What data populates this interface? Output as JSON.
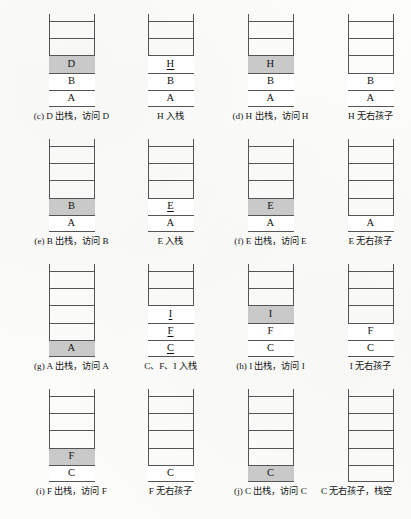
{
  "figure": {
    "type": "stack-trace-diagram",
    "colors": {
      "page_background": "#fdfdfc",
      "stack_line": "#555555",
      "cell_fill": "#ffffff",
      "highlight_fill": "#c9c9c9",
      "text": "#111111"
    },
    "stack_capacity": 5,
    "panels": [
      {
        "id": "panel-c-pop-d",
        "row": 1,
        "col": 1,
        "caption": "(c) D 出栈，访问 D",
        "cells": [
          {
            "label": "",
            "state": "empty",
            "underlined": false
          },
          {
            "label": "",
            "state": "empty",
            "underlined": false
          },
          {
            "label": "D",
            "state": "highlight",
            "underlined": false
          },
          {
            "label": "B",
            "state": "filled",
            "underlined": false
          },
          {
            "label": "A",
            "state": "filled",
            "underlined": false
          }
        ]
      },
      {
        "id": "panel-push-h",
        "row": 1,
        "col": 2,
        "caption": "H 入栈",
        "cells": [
          {
            "label": "",
            "state": "empty",
            "underlined": false
          },
          {
            "label": "",
            "state": "empty",
            "underlined": false
          },
          {
            "label": "H",
            "state": "filled",
            "underlined": true
          },
          {
            "label": "B",
            "state": "filled",
            "underlined": false
          },
          {
            "label": "A",
            "state": "filled",
            "underlined": false
          }
        ]
      },
      {
        "id": "panel-d-pop-h",
        "row": 1,
        "col": 3,
        "caption": "(d) H 出栈，访问 H",
        "cells": [
          {
            "label": "",
            "state": "empty",
            "underlined": false
          },
          {
            "label": "",
            "state": "empty",
            "underlined": false
          },
          {
            "label": "H",
            "state": "highlight",
            "underlined": false
          },
          {
            "label": "B",
            "state": "filled",
            "underlined": false
          },
          {
            "label": "A",
            "state": "filled",
            "underlined": false
          }
        ]
      },
      {
        "id": "panel-h-no-right-child",
        "row": 1,
        "col": 4,
        "caption": "H 无右孩子",
        "cells": [
          {
            "label": "",
            "state": "empty",
            "underlined": false
          },
          {
            "label": "",
            "state": "empty",
            "underlined": false
          },
          {
            "label": "",
            "state": "empty",
            "underlined": false
          },
          {
            "label": "B",
            "state": "filled",
            "underlined": false
          },
          {
            "label": "A",
            "state": "filled",
            "underlined": false
          }
        ]
      },
      {
        "id": "panel-e-pop-b",
        "row": 2,
        "col": 1,
        "caption": "(e) B 出栈，访问 B",
        "cells": [
          {
            "label": "",
            "state": "empty",
            "underlined": false
          },
          {
            "label": "",
            "state": "empty",
            "underlined": false
          },
          {
            "label": "",
            "state": "empty",
            "underlined": false
          },
          {
            "label": "B",
            "state": "highlight",
            "underlined": false
          },
          {
            "label": "A",
            "state": "filled",
            "underlined": false
          }
        ]
      },
      {
        "id": "panel-push-e",
        "row": 2,
        "col": 2,
        "caption": "E 入栈",
        "cells": [
          {
            "label": "",
            "state": "empty",
            "underlined": false
          },
          {
            "label": "",
            "state": "empty",
            "underlined": false
          },
          {
            "label": "",
            "state": "empty",
            "underlined": false
          },
          {
            "label": "E",
            "state": "filled",
            "underlined": true
          },
          {
            "label": "A",
            "state": "filled",
            "underlined": false
          }
        ]
      },
      {
        "id": "panel-f-pop-e",
        "row": 2,
        "col": 3,
        "caption": "(f) E 出栈，访问 E",
        "cells": [
          {
            "label": "",
            "state": "empty",
            "underlined": false
          },
          {
            "label": "",
            "state": "empty",
            "underlined": false
          },
          {
            "label": "",
            "state": "empty",
            "underlined": false
          },
          {
            "label": "E",
            "state": "highlight",
            "underlined": false
          },
          {
            "label": "A",
            "state": "filled",
            "underlined": false
          }
        ]
      },
      {
        "id": "panel-e-no-right-child",
        "row": 2,
        "col": 4,
        "caption": "E 无右孩子",
        "cells": [
          {
            "label": "",
            "state": "empty",
            "underlined": false
          },
          {
            "label": "",
            "state": "empty",
            "underlined": false
          },
          {
            "label": "",
            "state": "empty",
            "underlined": false
          },
          {
            "label": "",
            "state": "empty",
            "underlined": false
          },
          {
            "label": "A",
            "state": "filled",
            "underlined": false
          }
        ]
      },
      {
        "id": "panel-g-pop-a",
        "row": 3,
        "col": 1,
        "caption": "(g) A 出栈，访问 A",
        "cells": [
          {
            "label": "",
            "state": "empty",
            "underlined": false
          },
          {
            "label": "",
            "state": "empty",
            "underlined": false
          },
          {
            "label": "",
            "state": "empty",
            "underlined": false
          },
          {
            "label": "",
            "state": "empty",
            "underlined": false
          },
          {
            "label": "A",
            "state": "highlight",
            "underlined": false
          }
        ]
      },
      {
        "id": "panel-push-c-f-i",
        "row": 3,
        "col": 2,
        "caption": "C、F、I 入栈",
        "cells": [
          {
            "label": "",
            "state": "empty",
            "underlined": false
          },
          {
            "label": "",
            "state": "empty",
            "underlined": false
          },
          {
            "label": "I",
            "state": "filled",
            "underlined": true
          },
          {
            "label": "F",
            "state": "filled",
            "underlined": true
          },
          {
            "label": "C",
            "state": "filled",
            "underlined": true
          }
        ]
      },
      {
        "id": "panel-h-pop-i",
        "row": 3,
        "col": 3,
        "caption": "(h) I 出栈，访问 I",
        "cells": [
          {
            "label": "",
            "state": "empty",
            "underlined": false
          },
          {
            "label": "",
            "state": "empty",
            "underlined": false
          },
          {
            "label": "I",
            "state": "highlight",
            "underlined": false
          },
          {
            "label": "F",
            "state": "filled",
            "underlined": false
          },
          {
            "label": "C",
            "state": "filled",
            "underlined": false
          }
        ]
      },
      {
        "id": "panel-i-no-right-child",
        "row": 3,
        "col": 4,
        "caption": "I 无右孩子",
        "cells": [
          {
            "label": "",
            "state": "empty",
            "underlined": false
          },
          {
            "label": "",
            "state": "empty",
            "underlined": false
          },
          {
            "label": "",
            "state": "empty",
            "underlined": false
          },
          {
            "label": "F",
            "state": "filled",
            "underlined": false
          },
          {
            "label": "C",
            "state": "filled",
            "underlined": false
          }
        ]
      },
      {
        "id": "panel-i-pop-f",
        "row": 4,
        "col": 1,
        "caption": "(i) F 出栈，访问 F",
        "cells": [
          {
            "label": "",
            "state": "empty",
            "underlined": false
          },
          {
            "label": "",
            "state": "empty",
            "underlined": false
          },
          {
            "label": "",
            "state": "empty",
            "underlined": false
          },
          {
            "label": "F",
            "state": "highlight",
            "underlined": false
          },
          {
            "label": "C",
            "state": "filled",
            "underlined": false
          }
        ]
      },
      {
        "id": "panel-f-no-right-child",
        "row": 4,
        "col": 2,
        "caption": "F 无右孩子",
        "cells": [
          {
            "label": "",
            "state": "empty",
            "underlined": false
          },
          {
            "label": "",
            "state": "empty",
            "underlined": false
          },
          {
            "label": "",
            "state": "empty",
            "underlined": false
          },
          {
            "label": "",
            "state": "empty",
            "underlined": false
          },
          {
            "label": "C",
            "state": "filled",
            "underlined": false
          }
        ]
      },
      {
        "id": "panel-j-pop-c",
        "row": 4,
        "col": 3,
        "caption": "(j) C 出栈，访问 C",
        "cells": [
          {
            "label": "",
            "state": "empty",
            "underlined": false
          },
          {
            "label": "",
            "state": "empty",
            "underlined": false
          },
          {
            "label": "",
            "state": "empty",
            "underlined": false
          },
          {
            "label": "",
            "state": "empty",
            "underlined": false
          },
          {
            "label": "C",
            "state": "highlight",
            "underlined": false
          }
        ]
      },
      {
        "id": "panel-c-no-right-child-stack-empty",
        "row": 4,
        "col": 4,
        "caption": "C 无右孩子，栈空",
        "caption_clipped": true,
        "cells": [
          {
            "label": "",
            "state": "empty",
            "underlined": false
          },
          {
            "label": "",
            "state": "empty",
            "underlined": false
          },
          {
            "label": "",
            "state": "empty",
            "underlined": false
          },
          {
            "label": "",
            "state": "empty",
            "underlined": false
          },
          {
            "label": "",
            "state": "empty",
            "underlined": false
          }
        ]
      }
    ]
  }
}
